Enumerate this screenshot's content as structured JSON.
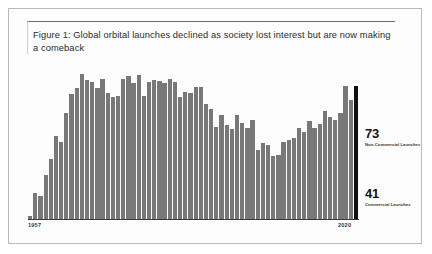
{
  "figure": {
    "title": "Figure 1: Global orbital launches declined as society lost interest but are now making a comeback"
  },
  "axis": {
    "year_start": "1957",
    "year_end": "2020"
  },
  "annotations": [
    {
      "value": "73",
      "caption": "Non-Commercial Launches"
    },
    {
      "value": "41",
      "caption": "Commercial Launches"
    }
  ],
  "colors": {
    "bar": "#787878",
    "highlight_bar": "#111111",
    "baseline": "#3b3b3b",
    "card_border": "#b9b9b9"
  },
  "chart_data": {
    "type": "bar",
    "title": "Figure 1: Global orbital launches declined as society lost interest but are now making a comeback",
    "xlabel": "",
    "ylabel": "",
    "grid": false,
    "legend": "none",
    "ylim": [
      0,
      130
    ],
    "xlim": [
      1957,
      2020
    ],
    "highlight_index": 63,
    "categories": [
      "1957",
      "1958",
      "1959",
      "1960",
      "1961",
      "1962",
      "1963",
      "1964",
      "1965",
      "1966",
      "1967",
      "1968",
      "1969",
      "1970",
      "1971",
      "1972",
      "1973",
      "1974",
      "1975",
      "1976",
      "1977",
      "1978",
      "1979",
      "1980",
      "1981",
      "1982",
      "1983",
      "1984",
      "1985",
      "1986",
      "1987",
      "1988",
      "1989",
      "1990",
      "1991",
      "1992",
      "1993",
      "1994",
      "1995",
      "1996",
      "1997",
      "1998",
      "1999",
      "2000",
      "2001",
      "2002",
      "2003",
      "2004",
      "2005",
      "2006",
      "2007",
      "2008",
      "2009",
      "2010",
      "2011",
      "2012",
      "2013",
      "2014",
      "2015",
      "2016",
      "2017",
      "2018",
      "2019",
      "2020"
    ],
    "values": [
      3,
      22,
      20,
      38,
      51,
      71,
      66,
      91,
      107,
      112,
      124,
      119,
      117,
      112,
      120,
      108,
      104,
      105,
      120,
      122,
      116,
      123,
      105,
      117,
      119,
      118,
      116,
      120,
      117,
      104,
      109,
      108,
      113,
      113,
      98,
      94,
      79,
      89,
      80,
      77,
      89,
      82,
      78,
      85,
      59,
      65,
      63,
      54,
      55,
      66,
      68,
      69,
      78,
      74,
      84,
      78,
      81,
      92,
      87,
      85,
      91,
      114,
      102,
      114
    ]
  }
}
